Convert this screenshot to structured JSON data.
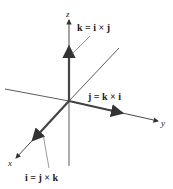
{
  "diagram": {
    "axes": [
      {
        "name": "x",
        "label": "x"
      },
      {
        "name": "y",
        "label": "y"
      },
      {
        "name": "z",
        "label": "z"
      }
    ],
    "vectors": [
      {
        "name": "k",
        "label": "k = i × j"
      },
      {
        "name": "j",
        "label": "j = k × i"
      },
      {
        "name": "i",
        "label": "i = j × k"
      }
    ],
    "colors": {
      "axis": "#333333",
      "vector": "#444444"
    }
  }
}
